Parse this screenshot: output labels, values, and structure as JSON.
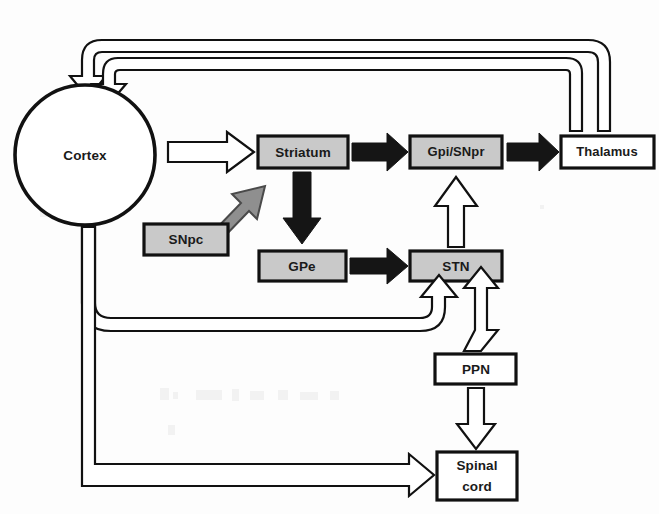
{
  "diagram": {
    "canvas": {
      "width": 659,
      "height": 514
    },
    "background_color": "#fdfdfd",
    "colors": {
      "shaded_node_fill": "#c9c9c9",
      "white_node_fill": "#ffffff",
      "outline": "#111111",
      "solid_arrow": "#151515",
      "gray_arrow_fill": "#8f8f8f",
      "gray_arrow_outline": "#4a4a4a"
    },
    "nodes": [
      {
        "id": "cortex",
        "label": "Cortex",
        "shape": "circle",
        "fill": "white",
        "cx": 85,
        "cy": 155,
        "r": 70
      },
      {
        "id": "striatum",
        "label": "Striatum",
        "shape": "rect",
        "fill": "shaded",
        "x": 258,
        "y": 136,
        "w": 90,
        "h": 32
      },
      {
        "id": "gpi_snpr",
        "label": "Gpi/SNpr",
        "shape": "rect",
        "fill": "shaded",
        "x": 410,
        "y": 136,
        "w": 92,
        "h": 32
      },
      {
        "id": "thalamus",
        "label": "Thalamus",
        "shape": "rect",
        "fill": "white",
        "x": 561,
        "y": 136,
        "w": 93,
        "h": 32
      },
      {
        "id": "snpc",
        "label": "SNpc",
        "shape": "rect",
        "fill": "shaded",
        "x": 144,
        "y": 224,
        "w": 84,
        "h": 31
      },
      {
        "id": "gpe",
        "label": "GPe",
        "shape": "rect",
        "fill": "shaded",
        "x": 259,
        "y": 251,
        "w": 87,
        "h": 30
      },
      {
        "id": "stn",
        "label": "STN",
        "shape": "rect",
        "fill": "shaded",
        "x": 410,
        "y": 251,
        "w": 92,
        "h": 30
      },
      {
        "id": "ppn",
        "label": "PPN",
        "shape": "rect",
        "fill": "white",
        "x": 435,
        "y": 354,
        "w": 81,
        "h": 30
      },
      {
        "id": "spinal_cord",
        "label_line1": "Spinal",
        "label_line2": "cord",
        "shape": "rect",
        "fill": "white",
        "x": 437,
        "y": 452,
        "w": 80,
        "h": 48
      }
    ],
    "edges": [
      {
        "id": "cortex-striatum",
        "from": "cortex",
        "to": "striatum",
        "style": "hollow",
        "kind": "excitatory"
      },
      {
        "id": "striatum-gpi",
        "from": "striatum",
        "to": "gpi_snpr",
        "style": "solid",
        "kind": "inhibitory"
      },
      {
        "id": "gpi-thalamus",
        "from": "gpi_snpr",
        "to": "thalamus",
        "style": "solid",
        "kind": "inhibitory"
      },
      {
        "id": "striatum-gpe",
        "from": "striatum",
        "to": "gpe",
        "style": "solid",
        "kind": "inhibitory"
      },
      {
        "id": "gpe-stn",
        "from": "gpe",
        "to": "stn",
        "style": "solid",
        "kind": "inhibitory"
      },
      {
        "id": "stn-gpi",
        "from": "stn",
        "to": "gpi_snpr",
        "style": "hollow",
        "kind": "excitatory"
      },
      {
        "id": "snpc-striatum",
        "from": "snpc",
        "to": "striatum",
        "style": "gray",
        "kind": "dopaminergic"
      },
      {
        "id": "thalamus-cortex",
        "from": "thalamus",
        "to": "cortex",
        "style": "hollow",
        "kind": "excitatory-feedback"
      },
      {
        "id": "gpi-cortex",
        "from": "gpi_snpr",
        "to": "cortex",
        "style": "hollow",
        "kind": "feedback"
      },
      {
        "id": "cortex-stn",
        "from": "cortex",
        "to": "stn",
        "style": "hollow",
        "kind": "hyperdirect"
      },
      {
        "id": "stn-ppn",
        "from": "stn",
        "to": "ppn",
        "style": "hollow",
        "kind": "bidirectional"
      },
      {
        "id": "ppn-spinal",
        "from": "ppn",
        "to": "spinal_cord",
        "style": "hollow",
        "kind": "descending"
      },
      {
        "id": "cortex-spinal",
        "from": "cortex",
        "to": "spinal_cord",
        "style": "hollow",
        "kind": "corticospinal"
      }
    ]
  }
}
